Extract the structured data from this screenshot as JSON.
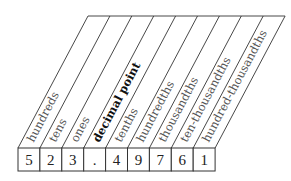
{
  "diagram": {
    "number": "523.49761",
    "columns": [
      {
        "label": "hundreds",
        "digit": "5",
        "emphasis": false
      },
      {
        "label": "tens",
        "digit": "2",
        "emphasis": false
      },
      {
        "label": "ones",
        "digit": "3",
        "emphasis": false
      },
      {
        "label": "decimal point",
        "digit": ".",
        "emphasis": true
      },
      {
        "label": "tenths",
        "digit": "4",
        "emphasis": false
      },
      {
        "label": "hundredths",
        "digit": "9",
        "emphasis": false
      },
      {
        "label": "thousandths",
        "digit": "7",
        "emphasis": false
      },
      {
        "label": "ten-thousandths",
        "digit": "6",
        "emphasis": false
      },
      {
        "label": "hundred-thousandths",
        "digit": "1",
        "emphasis": false
      }
    ],
    "colors": {
      "line": "#333333",
      "label": "#555555",
      "label_emphasis": "#111111",
      "digit": "#222222"
    }
  }
}
